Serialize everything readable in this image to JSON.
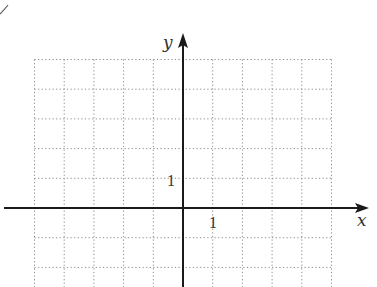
{
  "chart_data": {
    "type": "coordinate-grid",
    "title": "",
    "xlabel": "x",
    "ylabel": "y",
    "x_tick_labels": [
      {
        "value": 1,
        "label": "1"
      }
    ],
    "y_tick_labels": [
      {
        "value": 1,
        "label": "1"
      }
    ],
    "grid": true,
    "grid_style": "dotted",
    "xlim": [
      -5,
      5
    ],
    "ylim": [
      -2,
      5
    ],
    "unit": 1,
    "series": []
  },
  "axes": {
    "x_label": "x",
    "y_label": "y",
    "x_tick": "1",
    "y_tick": "1"
  },
  "colors": {
    "axis": "#1a1a1a",
    "grid": "#8a8a8a",
    "text": "#333333",
    "background": "#ffffff"
  }
}
